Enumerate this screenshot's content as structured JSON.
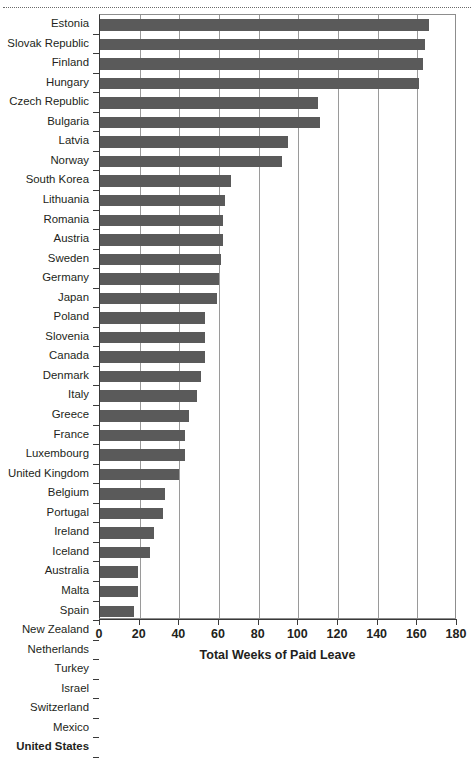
{
  "chart_data": {
    "type": "bar",
    "orientation": "horizontal",
    "title": "",
    "xlabel": "Total Weeks of Paid Leave",
    "ylabel": "",
    "xlim": [
      0,
      180
    ],
    "xticks": [
      0,
      20,
      40,
      60,
      80,
      100,
      120,
      140,
      160,
      180
    ],
    "grid": "vertical",
    "legend": "none",
    "bar_color": "#5a5a5a",
    "emphasized_categories": [
      "United States"
    ],
    "categories": [
      "Estonia",
      "Slovak Republic",
      "Finland",
      "Hungary",
      "Czech Republic",
      "Bulgaria",
      "Latvia",
      "Norway",
      "South Korea",
      "Lithuania",
      "Romania",
      "Austria",
      "Sweden",
      "Germany",
      "Japan",
      "Poland",
      "Slovenia",
      "Canada",
      "Denmark",
      "Italy",
      "Greece",
      "France",
      "Luxembourg",
      "United Kingdom",
      "Belgium",
      "Portugal",
      "Ireland",
      "Iceland",
      "Australia",
      "Malta",
      "Spain",
      "New Zealand",
      "Netherlands",
      "Turkey",
      "Israel",
      "Switzerland",
      "Mexico",
      "United States"
    ],
    "values": [
      166,
      164,
      163,
      161,
      110,
      111,
      95,
      92,
      66,
      63,
      62,
      62,
      61,
      60,
      59,
      53,
      53,
      53,
      51,
      49,
      45,
      43,
      43,
      40,
      33,
      32,
      27,
      25,
      19,
      19,
      17,
      17,
      17,
      16,
      15,
      15,
      12,
      0
    ]
  }
}
